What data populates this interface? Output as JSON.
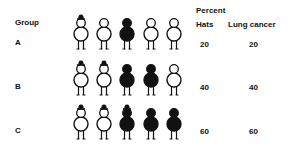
{
  "headers": {
    "group": "Group",
    "percent": "Percent",
    "hats": "Hats",
    "lung_cancer": "Lung cancer"
  },
  "rows": [
    {
      "group": "A",
      "hats": "20",
      "lung_cancer": "20",
      "figures": [
        {
          "hat": true,
          "cancer": false
        },
        {
          "hat": false,
          "cancer": false
        },
        {
          "hat": false,
          "cancer": true
        },
        {
          "hat": false,
          "cancer": false
        },
        {
          "hat": false,
          "cancer": false
        }
      ]
    },
    {
      "group": "B",
      "hats": "40",
      "lung_cancer": "40",
      "figures": [
        {
          "hat": true,
          "cancer": false
        },
        {
          "hat": true,
          "cancer": false
        },
        {
          "hat": false,
          "cancer": true
        },
        {
          "hat": false,
          "cancer": true
        },
        {
          "hat": false,
          "cancer": false
        }
      ]
    },
    {
      "group": "C",
      "hats": "60",
      "lung_cancer": "60",
      "figures": [
        {
          "hat": true,
          "cancer": false
        },
        {
          "hat": true,
          "cancer": false
        },
        {
          "hat": true,
          "cancer": true
        },
        {
          "hat": false,
          "cancer": true
        },
        {
          "hat": false,
          "cancer": true
        }
      ]
    }
  ],
  "legend_semantics": {
    "filled_figure": "lung cancer",
    "hat_glyph": "wears hat"
  },
  "colors": {
    "ink": "#111111",
    "background": "#ffffff"
  }
}
